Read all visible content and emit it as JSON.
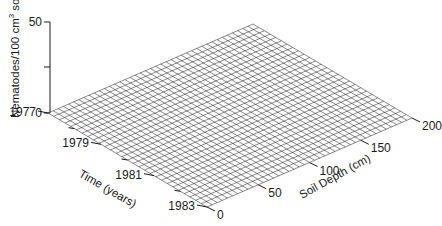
{
  "chart_data": {
    "type": "surface",
    "title": "",
    "zlabel": "Nematodes/100 cm³ soil",
    "zlabel_parts": {
      "main": "Nematodes/100 cm",
      "sup": "3",
      "tail": " soil"
    },
    "xlabel": "Time (years)",
    "ylabel": "Soil Depth (cm)",
    "zlim": [
      0,
      50
    ],
    "z_ticks": [
      "0",
      "",
      "50"
    ],
    "z_tick_values": [
      0,
      25,
      50
    ],
    "time_ticks": [
      "1977",
      "1979",
      "1981",
      "1983"
    ],
    "time_tick_values": [
      1977,
      1979,
      1981,
      1983
    ],
    "time_range": [
      1977,
      1983
    ],
    "depth_ticks": [
      "0",
      "50",
      "100",
      "150",
      "200"
    ],
    "depth_tick_values": [
      0,
      50,
      100,
      150,
      200
    ],
    "depth_range": [
      0,
      200
    ],
    "grid": {
      "time_lines": 28,
      "depth_lines": 40
    },
    "surface_values_description": "flat surface at 0 nematodes across all time and depth",
    "surface_z_value": 0
  }
}
